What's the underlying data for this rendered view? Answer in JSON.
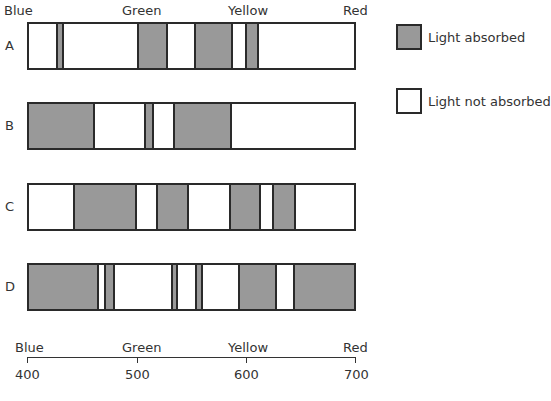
{
  "top_labels": [
    {
      "text": "Blue",
      "x": 4
    },
    {
      "text": "Green",
      "x": 122
    },
    {
      "text": "Yellow",
      "x": 228
    },
    {
      "text": "Red",
      "x": 343
    }
  ],
  "bars": [
    {
      "label": "A",
      "top": 22,
      "bands_px": [
        [
          56,
          64
        ],
        [
          137,
          168
        ],
        [
          194,
          233
        ],
        [
          245,
          259
        ]
      ]
    },
    {
      "label": "B",
      "top": 102,
      "bands_px": [
        [
          27,
          93
        ],
        [
          144,
          154
        ],
        [
          173,
          232
        ]
      ]
    },
    {
      "label": "C",
      "top": 183,
      "bands_px": [
        [
          73,
          137
        ],
        [
          156,
          189
        ],
        [
          229,
          261
        ],
        [
          272,
          296
        ]
      ]
    },
    {
      "label": "D",
      "top": 263,
      "bands_px": [
        [
          27,
          97
        ],
        [
          104,
          115
        ],
        [
          171,
          178
        ],
        [
          195,
          203
        ],
        [
          238,
          277
        ],
        [
          293,
          356
        ]
      ]
    }
  ],
  "bands_nm": {
    "A": [
      [
        426,
        434
      ],
      [
        500,
        528
      ],
      [
        552,
        588
      ],
      [
        598,
        611
      ]
    ],
    "B": [
      [
        400,
        460
      ],
      [
        507,
        516
      ],
      [
        533,
        587
      ]
    ],
    "C": [
      [
        442,
        500
      ],
      [
        517,
        547
      ],
      [
        584,
        613
      ],
      [
        623,
        645
      ]
    ],
    "D": [
      [
        400,
        464
      ],
      [
        470,
        480
      ],
      [
        531,
        537
      ],
      [
        553,
        560
      ],
      [
        592,
        628
      ],
      [
        643,
        700
      ]
    ]
  },
  "legend": {
    "absorbed": {
      "label": "Light absorbed",
      "color": "#999999"
    },
    "not_absorbed": {
      "label": "Light not absorbed",
      "color": "#ffffff"
    }
  },
  "axis": {
    "colors": [
      "Blue",
      "Green",
      "Yellow",
      "Red"
    ],
    "ticks": [
      "400",
      "500",
      "600",
      "700"
    ],
    "tick_x": [
      27,
      137,
      246,
      356
    ],
    "range_nm": [
      400,
      700
    ]
  }
}
